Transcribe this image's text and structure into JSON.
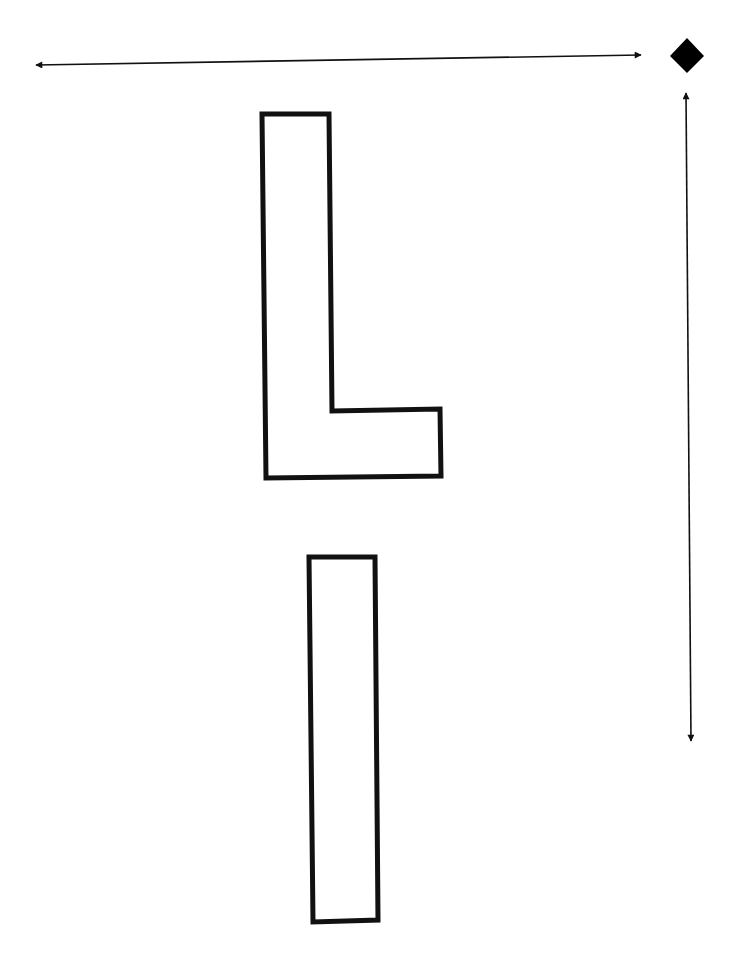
{
  "diagram": {
    "shapes": [
      {
        "id": "letter-L",
        "kind": "outlined-letter",
        "letter": "L"
      },
      {
        "id": "letter-I",
        "kind": "outlined-letter",
        "letter": "I"
      }
    ],
    "markers": [
      {
        "id": "orientation-diamond",
        "kind": "filled-diamond"
      }
    ],
    "arrows": [
      {
        "id": "horizontal-arrow",
        "direction": "left-right",
        "heads": "both"
      },
      {
        "id": "vertical-arrow",
        "direction": "up-down",
        "heads": "both"
      }
    ],
    "colors": {
      "stroke": "#111111",
      "background": "#ffffff"
    }
  }
}
